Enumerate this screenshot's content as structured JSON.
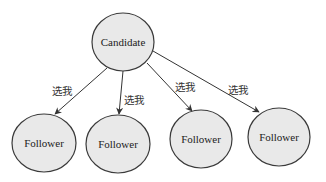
{
  "colors": {
    "node_fill": "#e9e9e9",
    "node_stroke": "#3a3a3a",
    "edge": "#333333",
    "background": "#ffffff"
  },
  "nodes": [
    {
      "id": "candidate",
      "label": "Candidate",
      "cx": 123,
      "cy": 42,
      "rx": 31,
      "ry": 29
    },
    {
      "id": "follower-1",
      "label": "Follower",
      "cx": 44,
      "cy": 143,
      "rx": 32,
      "ry": 29
    },
    {
      "id": "follower-2",
      "label": "Follower",
      "cx": 118,
      "cy": 144,
      "rx": 32,
      "ry": 29
    },
    {
      "id": "follower-3",
      "label": "Follower",
      "cx": 201,
      "cy": 139,
      "rx": 31,
      "ry": 29
    },
    {
      "id": "follower-4",
      "label": "Follower",
      "cx": 279,
      "cy": 137,
      "rx": 31,
      "ry": 29
    }
  ],
  "edges": [
    {
      "from": "candidate",
      "to": "follower-1",
      "label": "选我",
      "x1": 107,
      "y1": 68,
      "x2": 55,
      "y2": 114,
      "lx": 52,
      "ly": 95
    },
    {
      "from": "candidate",
      "to": "follower-2",
      "label": "选我",
      "x1": 123,
      "y1": 71,
      "x2": 119,
      "y2": 114,
      "lx": 124,
      "ly": 104
    },
    {
      "from": "candidate",
      "to": "follower-3",
      "label": "选我",
      "x1": 147,
      "y1": 63,
      "x2": 192,
      "y2": 111,
      "lx": 175,
      "ly": 91
    },
    {
      "from": "candidate",
      "to": "follower-4",
      "label": "选我",
      "x1": 153,
      "y1": 51,
      "x2": 259,
      "y2": 112,
      "lx": 228,
      "ly": 94
    }
  ]
}
